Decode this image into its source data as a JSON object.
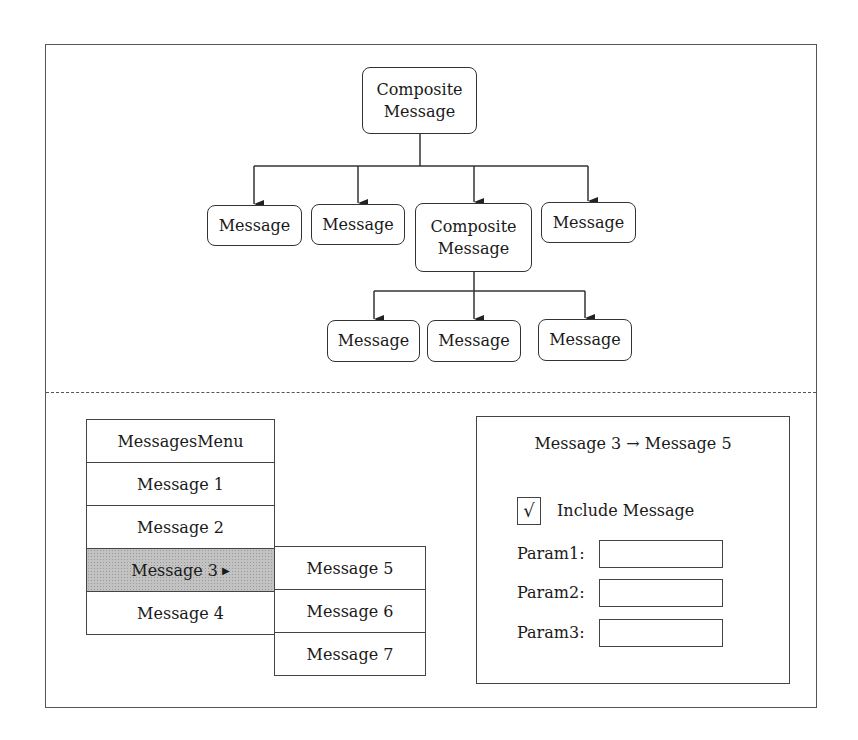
{
  "diagram": {
    "root": {
      "line1": "Composite",
      "line2": "Message"
    },
    "level1": [
      {
        "label": "Message"
      },
      {
        "label": "Message"
      },
      {
        "line1": "Composite",
        "line2": "Message"
      },
      {
        "label": "Message"
      }
    ],
    "level2": [
      {
        "label": "Message"
      },
      {
        "label": "Message"
      },
      {
        "label": "Message"
      }
    ]
  },
  "menu": {
    "title": "MessagesMenu",
    "items": [
      {
        "label": "Message 1"
      },
      {
        "label": "Message 2"
      },
      {
        "label": "Message 3",
        "has_submenu": true,
        "submenu_arrow": "▶"
      },
      {
        "label": "Message 4"
      }
    ],
    "submenu": [
      {
        "label": "Message 5"
      },
      {
        "label": "Message 6"
      },
      {
        "label": "Message 7"
      }
    ]
  },
  "panel": {
    "title": "Message 3 → Message 5",
    "checkbox": {
      "checked_glyph": "√",
      "label": "Include Message"
    },
    "params": [
      {
        "label": "Param1:",
        "value": ""
      },
      {
        "label": "Param2:",
        "value": ""
      },
      {
        "label": "Param3:",
        "value": ""
      }
    ]
  }
}
